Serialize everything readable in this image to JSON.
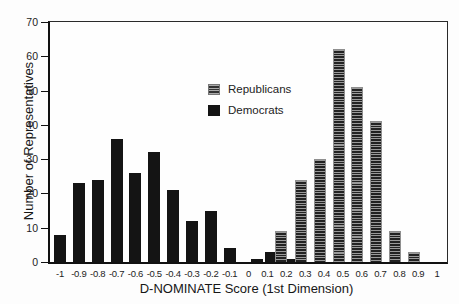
{
  "chart_data": {
    "type": "bar",
    "title": "",
    "xlabel": "D-NOMINATE Score (1st Dimension)",
    "ylabel": "Number of Representatives",
    "xlim": [
      -1.1,
      1.1
    ],
    "ylim": [
      0,
      70
    ],
    "grid": false,
    "legend_position": "inside-upper-middle",
    "colors": {
      "democrats": "#141414",
      "republicans_stripe_light": "#9a9a9a",
      "republicans_stripe_dark": "#222222",
      "axis": "#111111"
    },
    "yticks": [
      0,
      10,
      20,
      30,
      40,
      50,
      60,
      70
    ],
    "xticks": [
      {
        "v": -1.0,
        "label": "-1"
      },
      {
        "v": -0.9,
        "label": "-0.9"
      },
      {
        "v": -0.8,
        "label": "-0.8"
      },
      {
        "v": -0.7,
        "label": "-0.7"
      },
      {
        "v": -0.6,
        "label": "-0.6"
      },
      {
        "v": -0.5,
        "label": "-0.5"
      },
      {
        "v": -0.4,
        "label": "-0.4"
      },
      {
        "v": -0.3,
        "label": "-0.3"
      },
      {
        "v": -0.2,
        "label": "-0.2"
      },
      {
        "v": -0.1,
        "label": "-0.1"
      },
      {
        "v": 0.0,
        "label": "0"
      },
      {
        "v": 0.1,
        "label": "0.1"
      },
      {
        "v": 0.2,
        "label": "0.2"
      },
      {
        "v": 0.3,
        "label": "0.3"
      },
      {
        "v": 0.4,
        "label": "0.4"
      },
      {
        "v": 0.5,
        "label": "0.5"
      },
      {
        "v": 0.6,
        "label": "0.6"
      },
      {
        "v": 0.7,
        "label": "0.7"
      },
      {
        "v": 0.8,
        "label": "0.8"
      },
      {
        "v": 0.9,
        "label": "0.9"
      },
      {
        "v": 1.0,
        "label": "1"
      }
    ],
    "legend": {
      "items": [
        {
          "label": "Republicans",
          "style": "striped"
        },
        {
          "label": "Democrats",
          "style": "solid"
        }
      ]
    },
    "series": [
      {
        "name": "Democrats",
        "style": "solid",
        "points": [
          {
            "x": -1.0,
            "y": 8
          },
          {
            "x": -0.9,
            "y": 23
          },
          {
            "x": -0.8,
            "y": 24
          },
          {
            "x": -0.7,
            "y": 36
          },
          {
            "x": -0.6,
            "y": 26
          },
          {
            "x": -0.5,
            "y": 32
          },
          {
            "x": -0.4,
            "y": 21
          },
          {
            "x": -0.3,
            "y": 12
          },
          {
            "x": -0.2,
            "y": 15
          },
          {
            "x": -0.1,
            "y": 4
          },
          {
            "x": 0.045,
            "y": 1
          },
          {
            "x": 0.12,
            "y": 3
          },
          {
            "x": 0.215,
            "y": 1
          }
        ]
      },
      {
        "name": "Republicans",
        "style": "striped",
        "points": [
          {
            "x": 0.175,
            "y": 9
          },
          {
            "x": 0.278,
            "y": 24
          },
          {
            "x": 0.378,
            "y": 30
          },
          {
            "x": 0.478,
            "y": 62
          },
          {
            "x": 0.578,
            "y": 51
          },
          {
            "x": 0.678,
            "y": 41
          },
          {
            "x": 0.778,
            "y": 9
          },
          {
            "x": 0.878,
            "y": 3
          }
        ]
      }
    ]
  }
}
